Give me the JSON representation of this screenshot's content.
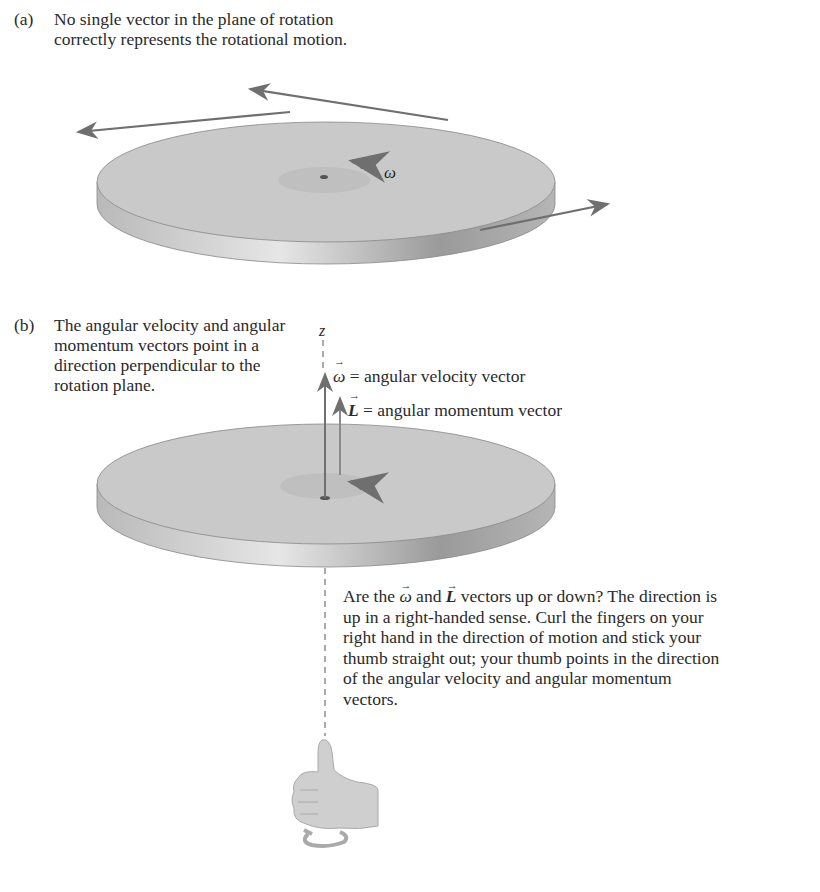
{
  "panel_a": {
    "tag": "(a)",
    "caption": "No single vector in the plane of rotation correctly represents the rotational motion.",
    "omega_label": "ω"
  },
  "panel_b": {
    "tag": "(b)",
    "caption": "The angular velocity and angular momentum vectors point in a direction perpendicular to the rotation plane.",
    "axis_label": "z",
    "omega_symbol": "ω",
    "omega_desc": "= angular velocity vector",
    "L_symbol": "L",
    "L_desc": "= angular momentum vector"
  },
  "note": {
    "prefix": "Are the",
    "omega_symbol": "ω",
    "and": "and",
    "L_symbol": "L",
    "rest": "vectors up or down? The direction is up in a right-handed sense. Curl the fingers on your right hand in the direction of motion and stick your thumb straight out; your thumb points in the direction of the angular velocity and angular momentum vectors."
  },
  "colors": {
    "disk_top": "#c9c9c9",
    "disk_edge": "#a9a9a9",
    "arrow": "#6f6f6f",
    "text": "#2a2a2a",
    "hand": "#cfcfcf"
  }
}
